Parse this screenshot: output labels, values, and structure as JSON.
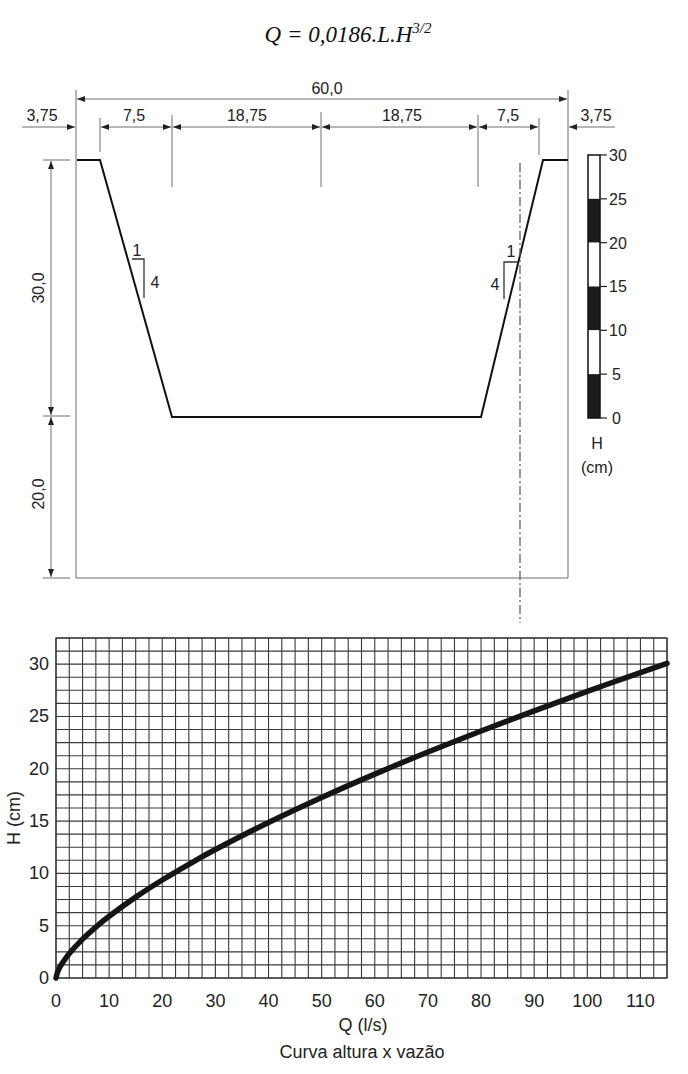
{
  "title": {
    "main": "Q = 0,0186.L.H",
    "exponent": "3/2"
  },
  "cross_section": {
    "overall_width": "60,0",
    "widths": [
      "3,75",
      "7,5",
      "18,75",
      "18,75",
      "7,5",
      "3,75"
    ],
    "heights": [
      "30,0",
      "20,0"
    ],
    "slope_left": {
      "run": "1",
      "rise": "4"
    },
    "slope_right": {
      "run": "1",
      "rise": "4"
    }
  },
  "gauge": {
    "labels": [
      "30",
      "25",
      "20",
      "15",
      "10",
      "5",
      "0"
    ],
    "symbol": "H",
    "unit": "(cm)"
  },
  "chart_data": {
    "type": "line",
    "title": "Curva altura x vazão",
    "xlabel": "Q (l/s)",
    "ylabel": "H (cm)",
    "xlim": [
      0,
      115
    ],
    "ylim": [
      0,
      32.5
    ],
    "xticks": [
      0,
      10,
      20,
      30,
      40,
      50,
      60,
      70,
      80,
      90,
      100,
      110
    ],
    "yticks": [
      0,
      5,
      10,
      15,
      20,
      25,
      30
    ],
    "grid": true,
    "grid_x_step": 2.5,
    "grid_y_step": 1.25,
    "legend": "none",
    "series": [
      {
        "name": "H x Q",
        "x": [
          0,
          0.25,
          0.5,
          1,
          2.5,
          5,
          7.5,
          10,
          15,
          20,
          25,
          30,
          40,
          50,
          60,
          70,
          80,
          90,
          100,
          110,
          115
        ],
        "y": [
          0,
          0.5,
          0.8,
          1.27,
          2.34,
          3.72,
          4.87,
          5.9,
          7.73,
          9.37,
          10.87,
          12.28,
          14.87,
          17.26,
          19.49,
          21.6,
          23.61,
          25.54,
          27.4,
          29.19,
          30.07
        ]
      }
    ]
  }
}
